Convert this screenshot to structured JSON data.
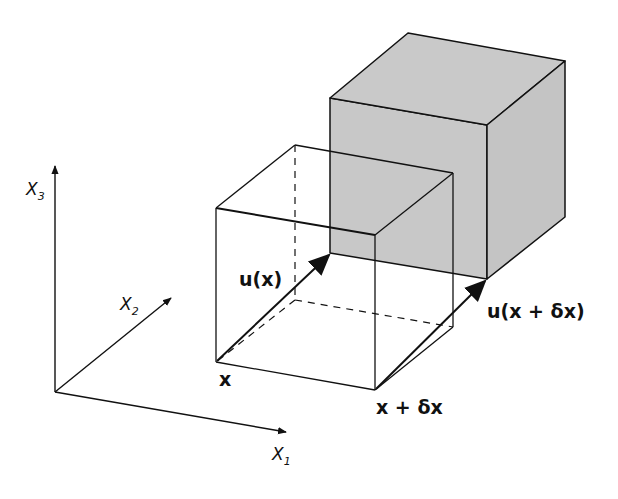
{
  "diagram": {
    "axes": {
      "x1": {
        "label": "X",
        "subscript": "1"
      },
      "x2": {
        "label": "X",
        "subscript": "2"
      },
      "x3": {
        "label": "X",
        "subscript": "3"
      }
    },
    "labels": {
      "point_x": "x",
      "point_x_dx": "x + δx",
      "disp_u_x": "u(x)",
      "disp_u_x_dx": "u(x + δx)"
    },
    "colors": {
      "line": "#111111",
      "deformed_fill": "#c8c8c8",
      "deformed_side": "#c2c2c2",
      "background": "#ffffff"
    }
  }
}
